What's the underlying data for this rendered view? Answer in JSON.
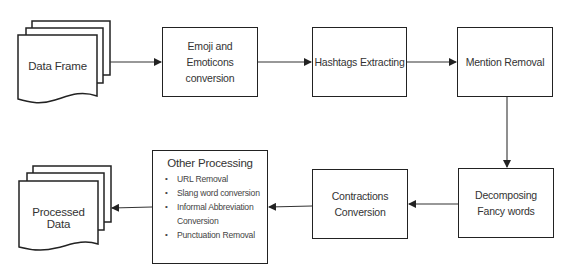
{
  "diagram": {
    "type": "flowchart",
    "colors": {
      "stroke": "#222222",
      "text": "#333333",
      "background": "#ffffff"
    },
    "nodes": {
      "data_frame": {
        "label": "Data Frame",
        "shape": "multi-document"
      },
      "emoji": {
        "label": "Emoji and Emoticons conversion",
        "shape": "rectangle"
      },
      "hashtags": {
        "label": "Hashtags Extracting",
        "shape": "rectangle"
      },
      "mention": {
        "label": "Mention Removal",
        "shape": "rectangle"
      },
      "decomposing": {
        "label": "Decomposing Fancy words",
        "shape": "rectangle"
      },
      "contractions": {
        "label": "Contractions Conversion",
        "shape": "rectangle"
      },
      "other": {
        "title": "Other Processing",
        "shape": "rectangle",
        "items": [
          "URL Removal",
          "Slang word conversion",
          "Informal Abbreviation Conversion",
          "Punctuation Removal"
        ]
      },
      "processed_data": {
        "label": "Processed Data",
        "shape": "multi-document"
      }
    },
    "edges": [
      {
        "from": "Data Frame",
        "to": "Emoji and Emoticons conversion"
      },
      {
        "from": "Emoji and Emoticons conversion",
        "to": "Hashtags Extracting"
      },
      {
        "from": "Hashtags Extracting",
        "to": "Mention Removal"
      },
      {
        "from": "Mention Removal",
        "to": "Decomposing Fancy words"
      },
      {
        "from": "Decomposing Fancy words",
        "to": "Contractions Conversion"
      },
      {
        "from": "Contractions Conversion",
        "to": "Other Processing"
      },
      {
        "from": "Other Processing",
        "to": "Processed Data"
      }
    ]
  }
}
